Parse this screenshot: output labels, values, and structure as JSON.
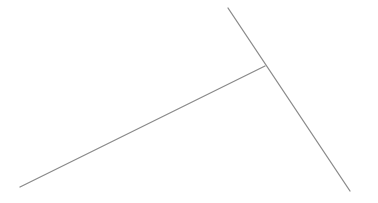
{
  "diagram": {
    "background": "#ffffff",
    "stroke_color": "#8a8a8a",
    "stroke_width": 1.3,
    "lines": [
      {
        "id": "long-diagonal",
        "x1": 228,
        "y1": 8,
        "x2": 350,
        "y2": 191
      },
      {
        "id": "branch",
        "x1": 265,
        "y1": 66,
        "x2": 20,
        "y2": 187
      }
    ],
    "junction": {
      "x": 265,
      "y": 66
    }
  }
}
